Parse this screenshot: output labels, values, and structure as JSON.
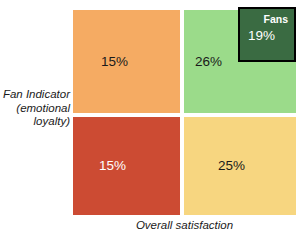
{
  "chart_data": {
    "type": "heatmap",
    "title": "",
    "xlabel": "Overall satisfaction",
    "ylabel": "Fan Indicator (emotional loyalty)",
    "grid": false,
    "legend": "none",
    "quadrants": [
      {
        "id": "top-left",
        "row": "high",
        "column": "low",
        "value": 15,
        "label": "15%",
        "color": "#F5AB63",
        "text_color": "#1a1a1a"
      },
      {
        "id": "top-right",
        "row": "high",
        "column": "high",
        "value": 26,
        "label": "26%",
        "color": "#9BDB8A",
        "text_color": "#1a1a1a"
      },
      {
        "id": "bottom-left",
        "row": "low",
        "column": "low",
        "value": 15,
        "label": "15%",
        "color": "#CC4B33",
        "text_color": "#ffffff"
      },
      {
        "id": "bottom-right",
        "row": "low",
        "column": "high",
        "value": 25,
        "label": "25%",
        "color": "#F7D680",
        "text_color": "#1a1a1a"
      }
    ],
    "highlight": {
      "name": "Fans",
      "value": 19,
      "label": "19%",
      "color": "#3A6B42",
      "border_color": "#000000",
      "text_color": "#ffffff",
      "within_quadrant": "top-right"
    }
  },
  "axes": {
    "y_label_lines": [
      "Fan Indicator",
      "(emotional",
      "loyalty)"
    ],
    "x_label": "Overall satisfaction"
  },
  "colors": {
    "background": "#ffffff",
    "orange": "#F5AB63",
    "light_green": "#9BDB8A",
    "red": "#CC4B33",
    "yellow": "#F7D680",
    "dark_green": "#3A6B42",
    "border": "#000000"
  }
}
